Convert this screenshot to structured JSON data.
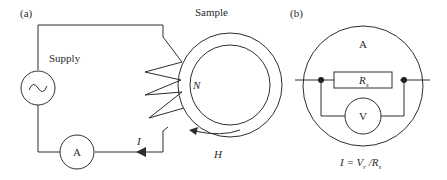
{
  "panel_a": {
    "label": "(a)",
    "supply_label": "Supply",
    "sample_label": "Sample",
    "turns_label": "N",
    "current_label": "I",
    "field_label": "H",
    "ammeter_label": "A"
  },
  "panel_b": {
    "label": "(b)",
    "ammeter_label": "A",
    "resistor_label": "R",
    "resistor_sub": "s",
    "voltmeter_label": "V",
    "formula": {
      "lhs": "I = V",
      "v_sub": "r",
      "mid": " /R",
      "r_sub": "s"
    }
  },
  "colors": {
    "line": "#2e2e2e",
    "text": "#2a2a2a",
    "background": "#ffffff"
  }
}
